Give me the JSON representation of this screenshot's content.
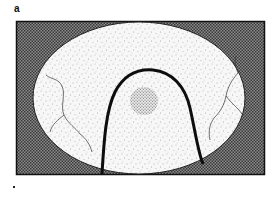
{
  "figure": {
    "panel_label": "a",
    "colors": {
      "background_fill": "#6e6e6e",
      "ellipse_fill": "#f4f4f4",
      "outline": "#111111",
      "stipple": "#555555"
    }
  }
}
